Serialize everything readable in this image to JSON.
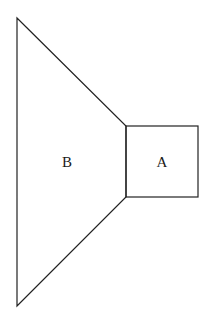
{
  "diagram": {
    "shapes": [
      {
        "id": "B",
        "type": "trapezoid",
        "label": "B",
        "points": [
          [
            17,
            18
          ],
          [
            126,
            126
          ],
          [
            126,
            197
          ],
          [
            17,
            306
          ]
        ]
      },
      {
        "id": "A",
        "type": "square",
        "label": "A",
        "rect": {
          "x": 126,
          "y": 126,
          "w": 72,
          "h": 71
        }
      }
    ],
    "labels": {
      "a": "A",
      "b": "B"
    },
    "colors": {
      "stroke": "#222222",
      "background": "#ffffff"
    }
  }
}
